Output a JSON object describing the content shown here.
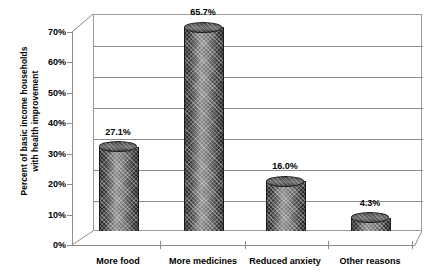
{
  "chart_data": {
    "type": "bar",
    "title": "",
    "xlabel": "",
    "ylabel": "Percent of basic income households with health improvement",
    "ylabel_line1": "Percent of basic income households",
    "ylabel_line2": "with health improvement",
    "categories": [
      "More food",
      "More medicines",
      "Reduced anxiety",
      "Other reasons"
    ],
    "values": [
      27.1,
      65.7,
      16.0,
      4.3
    ],
    "data_labels": [
      "27.1%",
      "65.7%",
      "16.0%",
      "4.3%"
    ],
    "ylim": [
      0,
      70
    ],
    "ytick_values": [
      0,
      10,
      20,
      30,
      40,
      50,
      60,
      70
    ],
    "ytick_labels": [
      "0%",
      "10%",
      "20%",
      "30%",
      "40%",
      "50%",
      "60%",
      "70%"
    ],
    "grid": true,
    "legend": "none",
    "style": "3d-cylinder-bars",
    "colors": {
      "bar_fill": "#4a4a4a",
      "bar_edge": "#1b1b1b",
      "grid": "#8d8d8d",
      "axis": "#8d8d8d",
      "text": "#000000",
      "background": "#ffffff"
    }
  }
}
